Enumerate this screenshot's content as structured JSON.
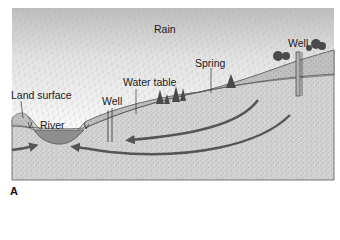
{
  "figure": {
    "panel_label": "A",
    "labels": {
      "rain": "Rain",
      "well_right": "Well",
      "spring": "Spring",
      "water_table": "Water table",
      "well_left": "Well",
      "land_surface": "Land surface",
      "river": "River"
    },
    "colors": {
      "sky_rain": "#c8c8c8",
      "aquifer": "#d2d2d2",
      "unsaturated_zone": "#bdbdbd",
      "river_water": "#8e8e8e",
      "arrow": "#555555",
      "outline": "#555555",
      "tree": "#4a4a4a"
    }
  }
}
